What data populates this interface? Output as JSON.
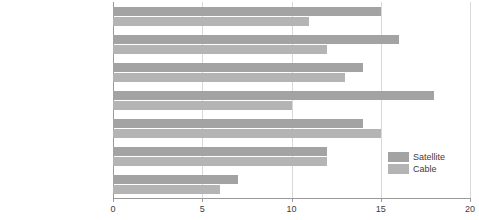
{
  "chart_data": {
    "type": "bar",
    "orientation": "horizontal",
    "title": "",
    "xlabel": "",
    "ylabel": "",
    "xlim": [
      0,
      20
    ],
    "xticks": [
      0,
      5,
      10,
      15,
      20
    ],
    "grid": true,
    "legend_position": "right",
    "categories": [
      "Professional",
      "Managerial and technical",
      "Skilled non-manual",
      "Skilled manual",
      "Partly skilled",
      "Unskilled",
      "Retired and unoccupied"
    ],
    "series": [
      {
        "name": "Satellite",
        "color": "#a3a3a3",
        "values": [
          15,
          16,
          14,
          18,
          14,
          12,
          7
        ]
      },
      {
        "name": "Cable",
        "color": "#b4b4b4",
        "values": [
          11,
          12,
          13,
          10,
          15,
          12,
          6
        ]
      }
    ]
  },
  "axis": {
    "tick_labels": [
      "0",
      "5",
      "10",
      "15",
      "20"
    ]
  },
  "legend": {
    "items": [
      {
        "label": "Satellite",
        "color": "#a3a3a3"
      },
      {
        "label": "Cable",
        "color": "#b4b4b4"
      }
    ]
  }
}
